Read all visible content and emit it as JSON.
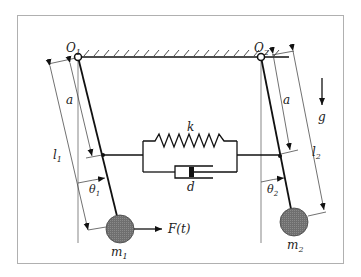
{
  "diagram": {
    "labels": {
      "pivot1": "O",
      "pivot1_sub": "1",
      "pivot2": "O",
      "pivot2_sub": "2",
      "a_left": "a",
      "a_right": "a",
      "l1": "l",
      "l1_sub": "1",
      "l2": "l",
      "l2_sub": "2",
      "theta1": "θ",
      "theta1_sub": "1",
      "theta2": "θ",
      "theta2_sub": "2",
      "spring": "k",
      "damper": "d",
      "mass1": "m",
      "mass1_sub": "1",
      "mass2": "m",
      "mass2_sub": "2",
      "force": "F(t)",
      "gravity": "g"
    },
    "colors": {
      "frame": "#b0b0b0",
      "line": "#111111",
      "mass_fill": "#7a7a7a",
      "thin": "#444444"
    }
  }
}
